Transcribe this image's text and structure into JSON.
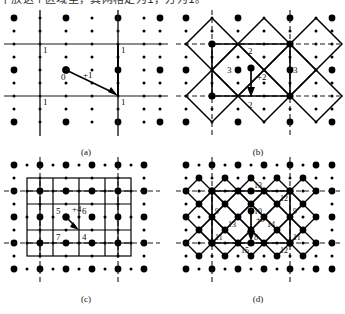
{
  "document": {
    "top_text": "下放这个区域里，其网格定为1，方为1。"
  },
  "figure": {
    "panels": [
      {
        "id": "a",
        "caption": "(a)",
        "level": 1,
        "center_label": "0",
        "increment_label": "+1",
        "corner_labels": [
          "1",
          "1",
          "1",
          "1"
        ],
        "grid_type": "square",
        "cells": 1
      },
      {
        "id": "b",
        "caption": "(b)",
        "level": 2,
        "center_label": "2",
        "increment_label": "+2",
        "labels": [
          "2",
          "3",
          "3",
          "2"
        ],
        "grid_type": "diamond",
        "cells": 4
      },
      {
        "id": "c",
        "caption": "(c)",
        "level": 3,
        "increment_label": "+4",
        "labels": [
          "5",
          "6",
          "7",
          "4"
        ],
        "grid_type": "square",
        "cells": 16
      },
      {
        "id": "d",
        "caption": "(d)",
        "level": 4,
        "increment_label": "+8",
        "labels": [
          "13",
          "12",
          "9",
          "10",
          "9",
          "13",
          "14",
          "11",
          "8",
          "11",
          "15",
          "12"
        ],
        "grid_type": "diamond",
        "cells": 32
      }
    ],
    "colors": {
      "ink": "#111111",
      "dot": "#000000",
      "line": "#1a1a1a"
    }
  }
}
